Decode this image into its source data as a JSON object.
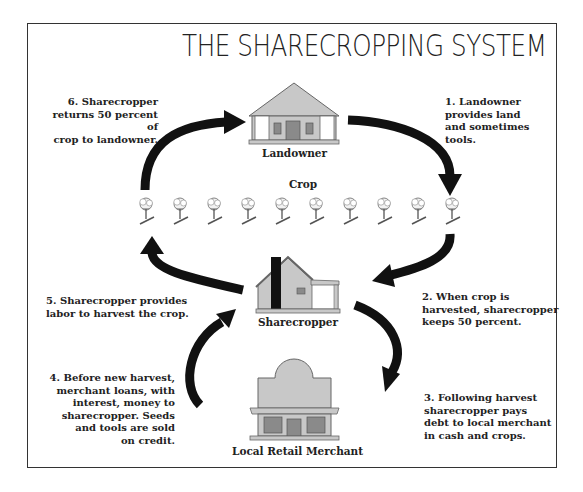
{
  "title": "THE SHARECROPPING SYSTEM",
  "nodes": {
    "landowner": {
      "label": "Landowner",
      "icon": "plantation-house-icon"
    },
    "crop": {
      "label": "Crop",
      "icon": "cotton-plant-icon",
      "plant_count": 10
    },
    "sharecropper": {
      "label": "Sharecropper",
      "icon": "cabin-icon"
    },
    "merchant": {
      "label": "Local Retail Merchant",
      "icon": "storefront-icon"
    }
  },
  "steps": [
    {
      "number": 1,
      "text": "1. Landowner\nprovides land\nand sometimes\ntools."
    },
    {
      "number": 2,
      "text": "2. When crop is\nharvested, sharecropper\nkeeps 50 percent."
    },
    {
      "number": 3,
      "text": "3. Following harvest\nsharecropper pays\ndebt to local merchant\nin cash and crops."
    },
    {
      "number": 4,
      "text": "4. Before new harvest,\nmerchant loans, with\ninterest, money to\nsharecropper. Seeds\nand tools are sold\non credit."
    },
    {
      "number": 5,
      "text": "5. Sharecropper provides\nlabor to harvest the crop."
    },
    {
      "number": 6,
      "text": "6. Sharecropper\nreturns 50 percent of\ncrop to landowner."
    }
  ],
  "colors": {
    "building_fill": "#c8c8c8",
    "building_dark": "#8a8a8a",
    "arrow": "#111111",
    "border": "#333333"
  }
}
